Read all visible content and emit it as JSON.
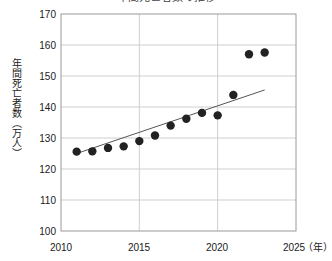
{
  "chart_data": {
    "type": "scatter",
    "title": "年間死亡者数の推移",
    "xlabel": "（年）",
    "ylabel": "年間死亡者数（万人）",
    "xlim": [
      2010,
      2025
    ],
    "ylim": [
      100,
      170
    ],
    "grid": true,
    "legend": false,
    "x_ticks": [
      "2010",
      "2015",
      "2020",
      "2025"
    ],
    "x_tick_values": [
      2010,
      2015,
      2020,
      2025
    ],
    "y_ticks": [
      "100",
      "110",
      "120",
      "130",
      "140",
      "150",
      "160",
      "170"
    ],
    "y_tick_values": [
      100,
      110,
      120,
      130,
      140,
      150,
      160,
      170
    ],
    "series": [
      {
        "name": "年間死亡者数",
        "marker": "filled-circle",
        "color": "#222222",
        "x": [
          2011,
          2012,
          2013,
          2014,
          2015,
          2016,
          2017,
          2018,
          2019,
          2020,
          2021,
          2022,
          2023
        ],
        "values": [
          125.6,
          125.7,
          126.8,
          127.3,
          129.0,
          130.8,
          134.0,
          136.2,
          138.1,
          137.3,
          143.9,
          157.0,
          157.6
        ]
      }
    ],
    "trendline": {
      "name": "近似直線",
      "color": "#555555",
      "x_start": 2011,
      "y_start": 125.0,
      "x_end": 2023,
      "y_end": 145.5
    }
  },
  "axes": {
    "x_unit": "（年）"
  }
}
